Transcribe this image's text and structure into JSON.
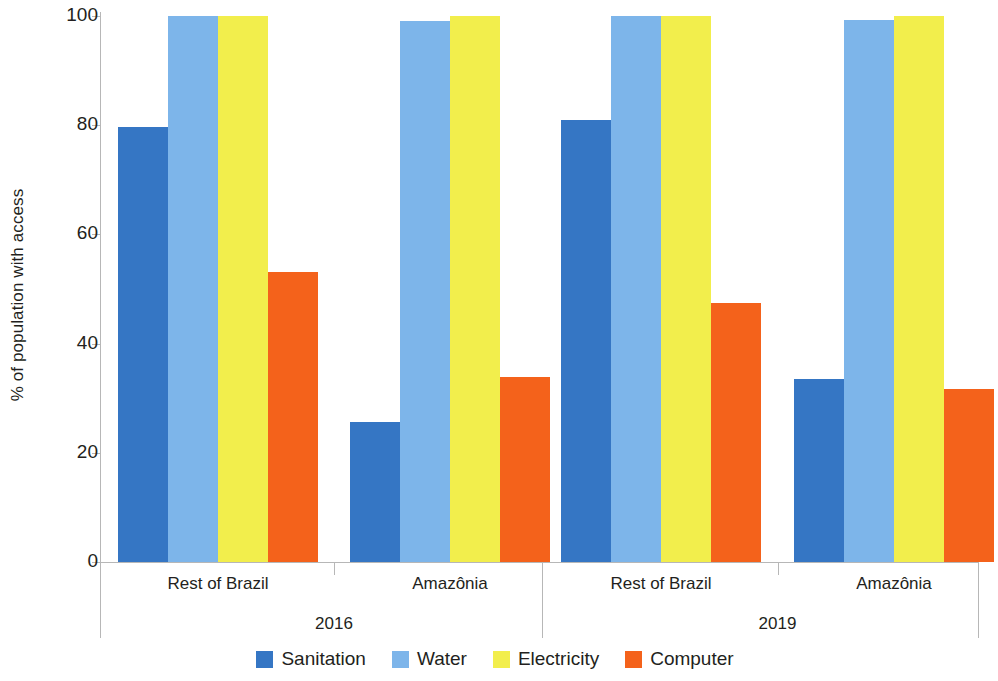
{
  "chart_data": {
    "type": "bar",
    "title": "",
    "xlabel": "",
    "ylabel": "% of population with access",
    "ylim": [
      0,
      100
    ],
    "yticks": [
      0,
      20,
      40,
      60,
      80,
      100
    ],
    "ytick_labels": [
      "0",
      "20",
      "40",
      "60",
      "80",
      "100"
    ],
    "grid": false,
    "legend_position": "bottom",
    "groups": [
      "2016",
      "2019"
    ],
    "categories": [
      "Rest of Brazil",
      "Amazônia",
      "Rest of Brazil",
      "Amazônia"
    ],
    "series": [
      {
        "name": "Sanitation",
        "color": "#3576c4",
        "values": [
          79.7,
          25.6,
          81.0,
          33.6
        ]
      },
      {
        "name": "Water",
        "color": "#7db5ea",
        "values": [
          100.0,
          99.0,
          100.0,
          99.2
        ]
      },
      {
        "name": "Electricity",
        "color": "#f2ee4c",
        "values": [
          100.0,
          100.0,
          100.0,
          100.0
        ]
      },
      {
        "name": "Computer",
        "color": "#f4621b",
        "values": [
          53.1,
          33.9,
          47.4,
          31.7
        ]
      }
    ]
  },
  "axis": {
    "y_title": "% of population with access",
    "ticks": [
      {
        "value": 100,
        "label": "100"
      },
      {
        "value": 80,
        "label": "80"
      },
      {
        "value": 60,
        "label": "60"
      },
      {
        "value": 40,
        "label": "40"
      },
      {
        "value": 20,
        "label": "20"
      },
      {
        "value": 0,
        "label": "0"
      }
    ]
  },
  "x_axis": {
    "categories": [
      {
        "label": "Rest of Brazil"
      },
      {
        "label": "Amazônia"
      },
      {
        "label": "Rest of Brazil"
      },
      {
        "label": "Amazônia"
      }
    ],
    "groups": [
      {
        "label": "2016"
      },
      {
        "label": "2019"
      }
    ]
  },
  "legend": {
    "items": [
      {
        "label": "Sanitation",
        "color": "#3576c4"
      },
      {
        "label": "Water",
        "color": "#7db5ea"
      },
      {
        "label": "Electricity",
        "color": "#f2ee4c"
      },
      {
        "label": "Computer",
        "color": "#f4621b"
      }
    ]
  }
}
